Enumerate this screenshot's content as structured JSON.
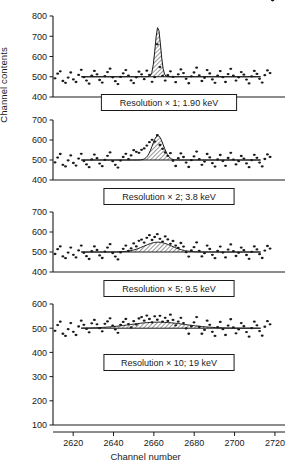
{
  "axes": {
    "ylabel": "Channel contents",
    "xlabel": "Channel number",
    "xticks": [
      "2620",
      "2640",
      "2660",
      "2680",
      "2700",
      "2720"
    ],
    "xlim": [
      2610,
      2725
    ]
  },
  "chart_data": {
    "type": "scatter",
    "title": "",
    "xlabel": "Channel number",
    "ylabel": "Channel contents",
    "xlim": [
      2610,
      2725
    ],
    "grid": false,
    "legend": null,
    "panels": [
      {
        "id": "panel-1",
        "label": "Resolution × 1; 1.90 keV",
        "resolution_factor": 1,
        "fwhm_keV": 1.9,
        "ylim": [
          400,
          800
        ],
        "yticks": [
          400,
          500,
          600,
          700,
          800
        ],
        "baseline": 500,
        "peak": {
          "center": 2662,
          "fwhm_channels": 3.2,
          "amplitude": 245,
          "shape": "gaussian",
          "fill": "hatched"
        },
        "noise_sigma": 22,
        "series": [
          {
            "name": "channel counts",
            "x": [
              2611,
              2612.3,
              2613.6,
              2614.9,
              2616.2,
              2617.5,
              2618.8,
              2620.1,
              2621.4,
              2622.7,
              2624,
              2625.3,
              2626.6,
              2627.9,
              2629.2,
              2630.5,
              2631.8,
              2633.1,
              2634.4,
              2635.7,
              2637,
              2638.3,
              2639.6,
              2640.9,
              2642.2,
              2643.5,
              2644.8,
              2646.1,
              2647.4,
              2648.7,
              2650,
              2651.3,
              2652.6,
              2653.9,
              2655.2,
              2656.5,
              2657.8,
              2659.1,
              2660.4,
              2661.7,
              2663,
              2664.3,
              2665.6,
              2666.9,
              2668.2,
              2669.5,
              2670.8,
              2672.1,
              2673.4,
              2674.7,
              2676,
              2677.3,
              2678.6,
              2679.9,
              2681.2,
              2682.5,
              2683.8,
              2685.1,
              2686.4,
              2687.7,
              2689,
              2690.3,
              2691.6,
              2692.9,
              2694.2,
              2695.5,
              2696.8,
              2698.1,
              2699.4,
              2700.7,
              2702,
              2703.3,
              2704.6,
              2705.9,
              2707.2,
              2708.5,
              2709.8,
              2711.1,
              2712.4,
              2713.7,
              2715,
              2716.3,
              2717.6,
              2718.9
            ],
            "y": [
              492,
              515,
              527,
              479,
              470,
              496,
              521,
              487,
              474,
              509,
              534,
              498,
              481,
              466,
              505,
              529,
              512,
              484,
              471,
              503,
              523,
              540,
              497,
              478,
              464,
              499,
              517,
              533,
              506,
              482,
              469,
              497,
              525,
              512,
              488,
              530,
              509,
              475,
              498,
              660,
              548,
              504,
              481,
              508,
              527,
              499,
              473,
              512,
              536,
              518,
              490,
              468,
              502,
              521,
              545,
              507,
              479,
              495,
              533,
              516,
              487,
              470,
              506,
              528,
              498,
              474,
              513,
              539,
              505,
              481,
              497,
              523,
              510,
              486,
              467,
              502,
              529,
              514,
              490,
              471,
              508,
              531,
              518
            ]
          }
        ]
      },
      {
        "id": "panel-2",
        "label": "Resolution × 2; 3.8 keV",
        "resolution_factor": 2,
        "fwhm_keV": 3.8,
        "ylim": [
          400,
          700
        ],
        "yticks": [
          400,
          500,
          600,
          700
        ],
        "baseline": 500,
        "peak": {
          "center": 2662,
          "fwhm_channels": 6.4,
          "amplitude": 122,
          "shape": "gaussian",
          "fill": "hatched"
        },
        "noise_sigma": 22,
        "series": [
          {
            "name": "channel counts",
            "x": [
              2611,
              2612.3,
              2613.6,
              2614.9,
              2616.2,
              2617.5,
              2618.8,
              2620.1,
              2621.4,
              2622.7,
              2624,
              2625.3,
              2626.6,
              2627.9,
              2629.2,
              2630.5,
              2631.8,
              2633.1,
              2634.4,
              2635.7,
              2637,
              2638.3,
              2639.6,
              2640.9,
              2642.2,
              2643.5,
              2644.8,
              2646.1,
              2647.4,
              2648.7,
              2650,
              2651.3,
              2652.6,
              2653.9,
              2655.2,
              2656.5,
              2657.8,
              2659.1,
              2660.4,
              2661.7,
              2663,
              2664.3,
              2665.6,
              2666.9,
              2668.2,
              2669.5,
              2670.8,
              2672.1,
              2673.4,
              2674.7,
              2676,
              2677.3,
              2678.6,
              2679.9,
              2681.2,
              2682.5,
              2683.8,
              2685.1,
              2686.4,
              2687.7,
              2689,
              2690.3,
              2691.6,
              2692.9,
              2694.2,
              2695.5,
              2696.8,
              2698.1,
              2699.4,
              2700.7,
              2702,
              2703.3,
              2704.6,
              2705.9,
              2707.2,
              2708.5,
              2709.8,
              2711.1,
              2712.4,
              2713.7,
              2715,
              2716.3,
              2717.6,
              2718.9
            ],
            "y": [
              488,
              512,
              530,
              476,
              468,
              498,
              523,
              485,
              472,
              507,
              531,
              495,
              478,
              464,
              503,
              527,
              509,
              482,
              469,
              501,
              521,
              538,
              494,
              476,
              462,
              497,
              515,
              531,
              504,
              523,
              549,
              541,
              536,
              551,
              558,
              572,
              589,
              601,
              592,
              624,
              575,
              556,
              538,
              521,
              534,
              496,
              470,
              509,
              533,
              515,
              487,
              465,
              499,
              518,
              542,
              504,
              476,
              492,
              530,
              513,
              484,
              467,
              503,
              525,
              495,
              471,
              510,
              536,
              502,
              478,
              494,
              520,
              507,
              483,
              464,
              499,
              526,
              511,
              487,
              468,
              505,
              528,
              515
            ]
          }
        ]
      },
      {
        "id": "panel-3",
        "label": "Resolution × 5; 9.5 keV",
        "resolution_factor": 5,
        "fwhm_keV": 9.5,
        "ylim": [
          400,
          700
        ],
        "yticks": [
          400,
          500,
          600,
          700
        ],
        "baseline": 500,
        "peak": {
          "center": 2662,
          "fwhm_channels": 16,
          "amplitude": 49,
          "shape": "gaussian",
          "fill": "hatched"
        },
        "noise_sigma": 22,
        "series": [
          {
            "name": "channel counts",
            "x": [
              2611,
              2612.3,
              2613.6,
              2614.9,
              2616.2,
              2617.5,
              2618.8,
              2620.1,
              2621.4,
              2622.7,
              2624,
              2625.3,
              2626.6,
              2627.9,
              2629.2,
              2630.5,
              2631.8,
              2633.1,
              2634.4,
              2635.7,
              2637,
              2638.3,
              2639.6,
              2640.9,
              2642.2,
              2643.5,
              2644.8,
              2646.1,
              2647.4,
              2648.7,
              2650,
              2651.3,
              2652.6,
              2653.9,
              2655.2,
              2656.5,
              2657.8,
              2659.1,
              2660.4,
              2661.7,
              2663,
              2664.3,
              2665.6,
              2666.9,
              2668.2,
              2669.5,
              2670.8,
              2672.1,
              2673.4,
              2674.7,
              2676,
              2677.3,
              2678.6,
              2679.9,
              2681.2,
              2682.5,
              2683.8,
              2685.1,
              2686.4,
              2687.7,
              2689,
              2690.3,
              2691.6,
              2692.9,
              2694.2,
              2695.5,
              2696.8,
              2698.1,
              2699.4,
              2700.7,
              2702,
              2703.3,
              2704.6,
              2705.9,
              2707.2,
              2708.5,
              2709.8,
              2711.1,
              2712.4,
              2713.7,
              2715,
              2716.3,
              2717.6,
              2718.9
            ],
            "y": [
              490,
              514,
              528,
              478,
              469,
              497,
              522,
              486,
              473,
              508,
              532,
              496,
              479,
              465,
              504,
              528,
              510,
              483,
              470,
              502,
              522,
              539,
              495,
              477,
              463,
              498,
              516,
              532,
              505,
              518,
              543,
              528,
              556,
              562,
              547,
              571,
              584,
              560,
              575,
              589,
              566,
              552,
              578,
              563,
              541,
              555,
              532,
              520,
              545,
              527,
              499,
              477,
              508,
              524,
              548,
              506,
              478,
              494,
              532,
              515,
              486,
              469,
              505,
              527,
              497,
              473,
              512,
              538,
              504,
              480,
              496,
              522,
              509,
              485,
              466,
              501,
              528,
              513,
              489,
              470,
              507,
              530,
              517
            ]
          }
        ]
      },
      {
        "id": "panel-4",
        "label": "Resolution × 10; 19 keV",
        "resolution_factor": 10,
        "fwhm_keV": 19,
        "ylim": [
          100,
          600
        ],
        "yticks": [
          100,
          200,
          300,
          400,
          500,
          600
        ],
        "baseline": 500,
        "peak": {
          "center": 2662,
          "fwhm_channels": 32,
          "amplitude": 25,
          "shape": "gaussian",
          "fill": "hatched"
        },
        "noise_sigma": 22,
        "series": [
          {
            "name": "channel counts",
            "x": [
              2611,
              2612.3,
              2613.6,
              2614.9,
              2616.2,
              2617.5,
              2618.8,
              2620.1,
              2621.4,
              2622.7,
              2624,
              2625.3,
              2626.6,
              2627.9,
              2629.2,
              2630.5,
              2631.8,
              2633.1,
              2634.4,
              2635.7,
              2637,
              2638.3,
              2639.6,
              2640.9,
              2642.2,
              2643.5,
              2644.8,
              2646.1,
              2647.4,
              2648.7,
              2650,
              2651.3,
              2652.6,
              2653.9,
              2655.2,
              2656.5,
              2657.8,
              2659.1,
              2660.4,
              2661.7,
              2663,
              2664.3,
              2665.6,
              2666.9,
              2668.2,
              2669.5,
              2670.8,
              2672.1,
              2673.4,
              2674.7,
              2676,
              2677.3,
              2678.6,
              2679.9,
              2681.2,
              2682.5,
              2683.8,
              2685.1,
              2686.4,
              2687.7,
              2689,
              2690.3,
              2691.6,
              2692.9,
              2694.2,
              2695.5,
              2696.8,
              2698.1,
              2699.4,
              2700.7,
              2702,
              2703.3,
              2704.6,
              2705.9,
              2707.2,
              2708.5,
              2709.8,
              2711.1,
              2712.4,
              2713.7,
              2715,
              2716.3,
              2717.6,
              2718.9
            ],
            "y": [
              489,
              513,
              527,
              477,
              468,
              496,
              521,
              485,
              472,
              507,
              531,
              514,
              497,
              483,
              520,
              534,
              516,
              500,
              487,
              518,
              528,
              541,
              511,
              495,
              481,
              514,
              526,
              538,
              517,
              503,
              529,
              515,
              540,
              546,
              531,
              552,
              538,
              524,
              549,
              535,
              551,
              527,
              543,
              530,
              556,
              534,
              512,
              527,
              543,
              521,
              499,
              477,
              508,
              524,
              546,
              505,
              477,
              493,
              531,
              514,
              485,
              468,
              504,
              526,
              496,
              472,
              511,
              537,
              503,
              479,
              495,
              521,
              508,
              484,
              465,
              500,
              527,
              512,
              488,
              469,
              506,
              529,
              516
            ]
          }
        ]
      }
    ]
  }
}
